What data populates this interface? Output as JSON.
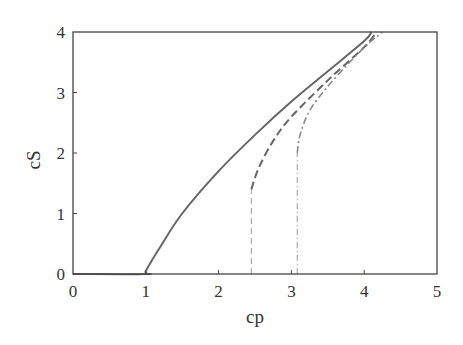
{
  "chart_data": {
    "type": "line",
    "title": "",
    "xlabel": "cp",
    "ylabel": "cS",
    "xlim": [
      0,
      5
    ],
    "ylim": [
      0,
      4
    ],
    "xticks": [
      0,
      1,
      2,
      3,
      4,
      5
    ],
    "yticks": [
      0,
      1,
      2,
      3,
      4
    ],
    "grid": false,
    "legend": null,
    "series": [
      {
        "name": "solid",
        "style": "solid",
        "color": "#666666",
        "x": [
          0,
          1.0,
          1.0,
          1.2,
          1.5,
          2.0,
          2.5,
          3.0,
          3.5,
          4.0,
          4.1
        ],
        "y": [
          0,
          0,
          0.05,
          0.45,
          1.0,
          1.7,
          2.3,
          2.85,
          3.35,
          3.85,
          4.0
        ]
      },
      {
        "name": "dashed",
        "style": "dashed",
        "color": "#666666",
        "x": [
          2.45,
          2.45,
          2.55,
          2.75,
          3.0,
          3.5,
          4.0,
          4.17
        ],
        "y": [
          0,
          1.4,
          1.75,
          2.2,
          2.6,
          3.2,
          3.75,
          4.0
        ]
      },
      {
        "name": "dash-dot",
        "style": "dashdot",
        "color": "#888888",
        "x": [
          3.08,
          3.08,
          3.12,
          3.25,
          3.5,
          3.8,
          4.05,
          4.25
        ],
        "y": [
          0,
          2.0,
          2.3,
          2.7,
          3.1,
          3.5,
          3.8,
          4.0
        ]
      }
    ]
  }
}
